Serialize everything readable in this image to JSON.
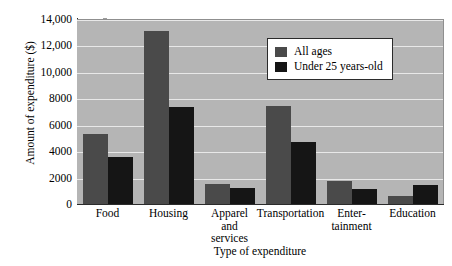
{
  "chart_data": {
    "type": "bar",
    "title": "",
    "xlabel": "Type of expenditure",
    "ylabel": "Amount of expenditure ($)",
    "categories": [
      "Food",
      "Housing",
      "Apparel\nand\nservices",
      "Transportation",
      "Enter-\ntainment",
      "Education"
    ],
    "category_labels": [
      [
        "Food"
      ],
      [
        "Housing"
      ],
      [
        "Apparel",
        "and",
        "services"
      ],
      [
        "Transportation"
      ],
      [
        "Enter-",
        "tainment"
      ],
      [
        "Education"
      ]
    ],
    "series": [
      {
        "name": "All ages",
        "color": "#4a4a4a",
        "values": [
          5400,
          13200,
          1600,
          7500,
          1800,
          700
        ]
      },
      {
        "name": "Under 25 years-old",
        "color": "#151515",
        "values": [
          3600,
          7400,
          1250,
          4800,
          1200,
          1500
        ]
      }
    ],
    "ylim": [
      0,
      14000
    ],
    "ytick_values": [
      0,
      2000,
      4000,
      6000,
      8000,
      10000,
      12000,
      14000
    ],
    "ytick_labels": [
      "0",
      "2000",
      "4000",
      "6000",
      "8000",
      "10,000",
      "12,000",
      "14,000"
    ],
    "grid": true,
    "grid_axis": "y",
    "grid_color": "#e8e8e8",
    "legend_position": "upper right",
    "plot_background": "#b5b5b5",
    "figure_background": "#ffffff",
    "axis_color": "#2b2b2b"
  },
  "legend": {
    "entries": [
      {
        "label": "All ages"
      },
      {
        "label": "Under 25 years-old"
      }
    ]
  },
  "axes": {
    "y_title": "Amount of expenditure ($)",
    "x_title": "Type of expenditure"
  }
}
